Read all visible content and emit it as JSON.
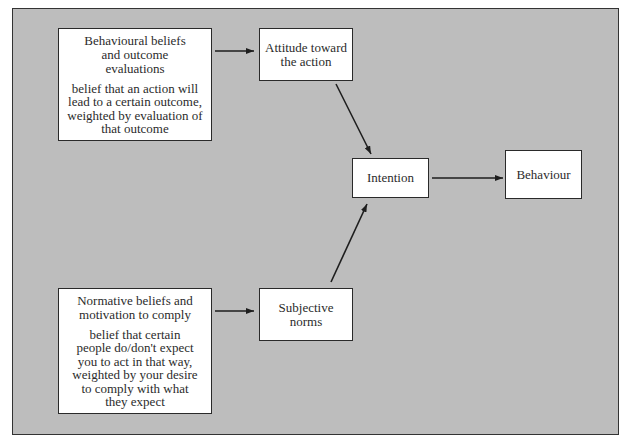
{
  "diagram": {
    "type": "flowchart",
    "nodes": {
      "behavioural_beliefs": {
        "title": "Behavioural beliefs and outcome evaluations",
        "description": "belief that an action will lead to a certain outcome, weighted by evaluation of that outcome"
      },
      "attitude": {
        "title": "Attitude toward the action"
      },
      "normative_beliefs": {
        "title": "Normative beliefs and motivation to comply",
        "description": "belief that certain people do/don't expect you to act in that way, weighted by your desire to comply with what they expect"
      },
      "subjective_norms": {
        "title": "Subjective norms"
      },
      "intention": {
        "title": "Intention"
      },
      "behaviour": {
        "title": "Behaviour"
      }
    },
    "edges": [
      {
        "from": "behavioural_beliefs",
        "to": "attitude"
      },
      {
        "from": "normative_beliefs",
        "to": "subjective_norms"
      },
      {
        "from": "attitude",
        "to": "intention"
      },
      {
        "from": "subjective_norms",
        "to": "intention"
      },
      {
        "from": "intention",
        "to": "behaviour"
      }
    ],
    "colors": {
      "background": "#bdbdbd",
      "node_fill": "#ffffff",
      "stroke": "#2a2a2a"
    }
  }
}
